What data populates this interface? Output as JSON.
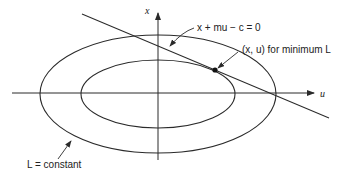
{
  "diagram": {
    "axes": {
      "vertical_label": "x",
      "horizontal_label": "u"
    },
    "annotations": {
      "constraint_line": "x + mu − c = 0",
      "minimum_point": "(x, u) for minimum L",
      "contour": "L = constant"
    },
    "colors": {
      "stroke": "#2a2a2a",
      "background": "#ffffff"
    }
  }
}
